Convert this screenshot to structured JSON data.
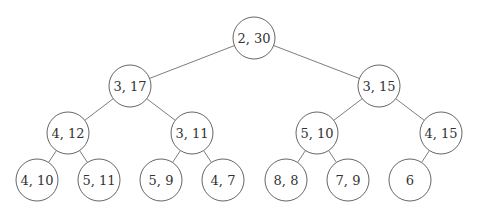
{
  "diagram": {
    "type": "binary-tree",
    "node_radius": 21,
    "nodes": [
      {
        "id": "n0",
        "label": "2, 30",
        "x": 254,
        "y": 38
      },
      {
        "id": "n1",
        "label": "3, 17",
        "x": 130,
        "y": 86
      },
      {
        "id": "n2",
        "label": "3, 15",
        "x": 379,
        "y": 86
      },
      {
        "id": "n3",
        "label": "4, 12",
        "x": 68,
        "y": 133
      },
      {
        "id": "n4",
        "label": "3, 11",
        "x": 192,
        "y": 133
      },
      {
        "id": "n5",
        "label": "5, 10",
        "x": 317,
        "y": 133
      },
      {
        "id": "n6",
        "label": "4, 15",
        "x": 441,
        "y": 133
      },
      {
        "id": "n7",
        "label": "4, 10",
        "x": 37,
        "y": 180
      },
      {
        "id": "n8",
        "label": "5, 11",
        "x": 99,
        "y": 180
      },
      {
        "id": "n9",
        "label": "5, 9",
        "x": 161,
        "y": 180
      },
      {
        "id": "n10",
        "label": "4, 7",
        "x": 223,
        "y": 180
      },
      {
        "id": "n11",
        "label": "8, 8",
        "x": 286,
        "y": 180
      },
      {
        "id": "n12",
        "label": "7, 9",
        "x": 348,
        "y": 180
      },
      {
        "id": "n13",
        "label": "6",
        "x": 410,
        "y": 180
      }
    ],
    "edges": [
      [
        "n0",
        "n1"
      ],
      [
        "n0",
        "n2"
      ],
      [
        "n1",
        "n3"
      ],
      [
        "n1",
        "n4"
      ],
      [
        "n2",
        "n5"
      ],
      [
        "n2",
        "n6"
      ],
      [
        "n3",
        "n7"
      ],
      [
        "n3",
        "n8"
      ],
      [
        "n4",
        "n9"
      ],
      [
        "n4",
        "n10"
      ],
      [
        "n5",
        "n11"
      ],
      [
        "n5",
        "n12"
      ],
      [
        "n6",
        "n13"
      ]
    ],
    "colors": {
      "stroke": "#555555",
      "edge": "#6e6e6e",
      "text": "#333333",
      "background": "#ffffff"
    }
  }
}
